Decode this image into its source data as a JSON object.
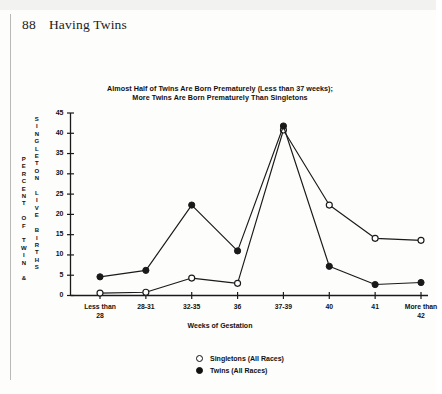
{
  "page": {
    "folio": "88",
    "running_head": "Having Twins"
  },
  "figure": {
    "title_line1": "Almost Half of Twins Are Born Prematurely (Less than 37 weeks);",
    "title_line2": "More Twins Are Born Prematurely Than Singletons",
    "y_axis_caption_outer": "P\nE\nR\nC\nE\nN\nT\n\nO\nF\n\nT\nW\nI\nN\n\n&",
    "y_axis_caption_inner": "S\nI\nN\nG\nL\nE\nT\nO\nN\n\nL\nI\nV\nE\n\nB\nI\nR\nT\nH\nS",
    "x_axis_title": "Weeks of Gestation",
    "legend": [
      {
        "key": "singletons",
        "marker": "open-circle",
        "label": "Singletons (All Races)"
      },
      {
        "key": "twins",
        "marker": "filled-circle",
        "label": "Twins (All Races)"
      }
    ]
  },
  "chart_data": {
    "type": "line",
    "title": "Almost Half of Twins Are Born Prematurely (Less than 37 weeks); More Twins Are Born Prematurely Than Singletons",
    "xlabel": "Weeks of Gestation",
    "ylabel": "PERCENT OF TWIN & SINGLETON LIVE BIRTHS",
    "categories": [
      "Less than\n28",
      "28-31",
      "32-35",
      "36",
      "37-39",
      "40",
      "41",
      "More than\n42"
    ],
    "categories_plain": [
      "Less than 28",
      "28-31",
      "32-35",
      "36",
      "37-39",
      "40",
      "41",
      "More than 42"
    ],
    "series": [
      {
        "name": "Singletons (All Races)",
        "marker": "open-circle",
        "values": [
          0.6,
          0.8,
          4.3,
          3.0,
          40.8,
          22.3,
          14.1,
          13.6
        ]
      },
      {
        "name": "Twins (All Races)",
        "marker": "filled-circle",
        "values": [
          4.6,
          6.2,
          22.3,
          11.0,
          41.8,
          7.2,
          2.7,
          3.2
        ]
      }
    ],
    "ylim": [
      0,
      45
    ],
    "yticks": [
      0,
      5,
      10,
      15,
      20,
      25,
      30,
      35,
      40,
      45
    ],
    "grid": false,
    "legend_position": "bottom-center"
  }
}
